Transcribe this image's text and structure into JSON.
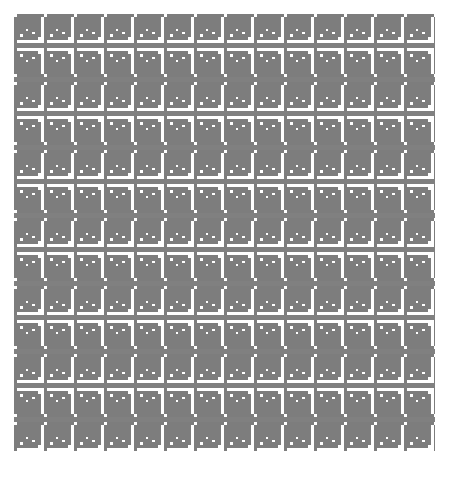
{
  "artwork": {
    "title": "Greek key meander repeating pattern",
    "type": "seamless-geometric-pattern",
    "canvas": {
      "width": 449,
      "height": 477
    },
    "plate": {
      "x": 14,
      "y": 14,
      "width": 421,
      "height": 442
    },
    "background_color": "#ffffff",
    "ink_color": "#7d7d7d",
    "rule_color": "#808080",
    "stroke_width_px": 3,
    "motif": {
      "name": "greek-key-meander",
      "cell_width_px": 30,
      "cell_height_px": 29,
      "orientations": [
        "down-right",
        "up-right"
      ]
    },
    "bands": {
      "count": 13,
      "motif_height_px": 29,
      "rule_height_px": 5,
      "period_px": 34,
      "alternating": true
    },
    "chart_data": {
      "type": "heatmap",
      "title": "Greek key meander repeating pattern",
      "categories": [
        "band-1",
        "band-2",
        "band-3",
        "band-4",
        "band-5",
        "band-6",
        "band-7",
        "band-8",
        "band-9",
        "band-10",
        "band-11",
        "band-12",
        "band-13"
      ],
      "series": [
        {
          "name": "motif-orientation",
          "values": [
            0,
            1,
            0,
            1,
            0,
            1,
            0,
            1,
            0,
            1,
            0,
            1,
            0
          ]
        },
        {
          "name": "band-top-y-px",
          "values": [
            14,
            48,
            82,
            116,
            150,
            184,
            218,
            252,
            286,
            320,
            354,
            388,
            422
          ]
        }
      ],
      "xlabel": "",
      "ylabel": "",
      "legend": [
        "orientation-A (down-right)",
        "orientation-B (up-right)"
      ],
      "grid": false
    }
  }
}
